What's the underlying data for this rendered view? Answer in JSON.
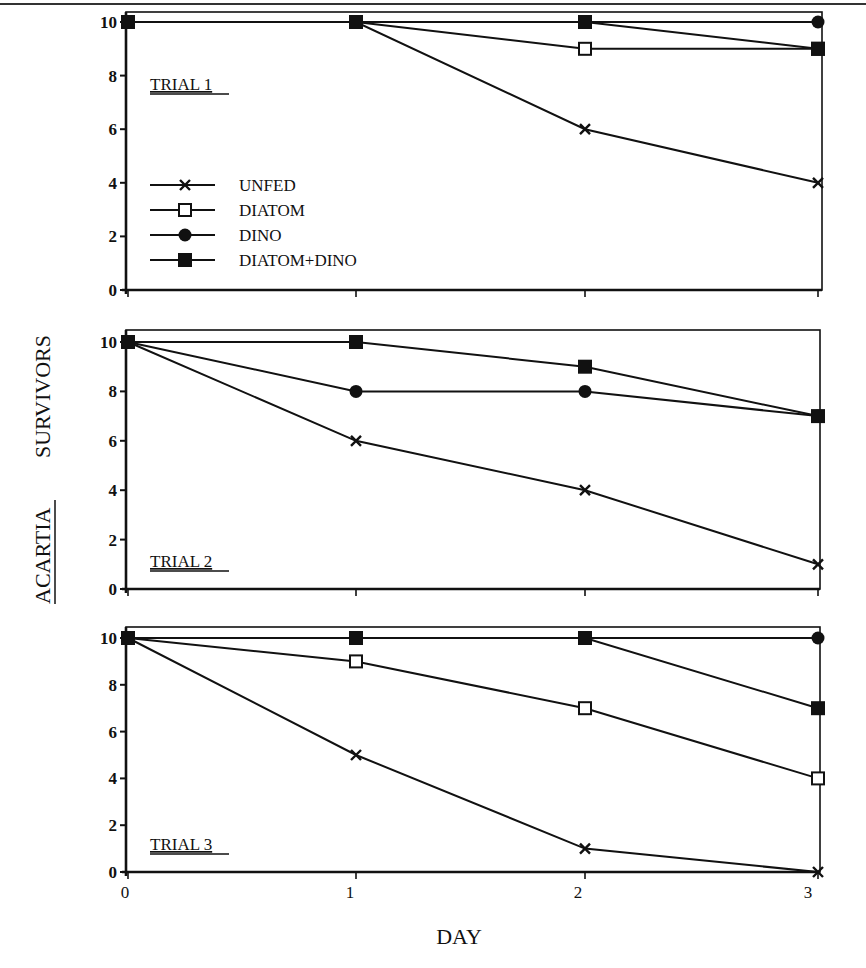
{
  "chart_data": [
    {
      "type": "line",
      "title": "TRIAL 1",
      "x": [
        0,
        1,
        2,
        3
      ],
      "xlabel": "DAY",
      "ylabel": "ACARTIA SURVIVORS",
      "ylim": [
        0,
        10
      ],
      "yticks": [
        0,
        2,
        4,
        6,
        8,
        10
      ],
      "series": [
        {
          "name": "UNFED",
          "marker": "x",
          "values": [
            10,
            10,
            6,
            4
          ]
        },
        {
          "name": "DIATOM",
          "marker": "open-square",
          "values": [
            10,
            10,
            9,
            9
          ]
        },
        {
          "name": "DINO",
          "marker": "filled-circle",
          "values": [
            10,
            10,
            10,
            10
          ]
        },
        {
          "name": "DIATOM+DINO",
          "marker": "filled-square",
          "values": [
            10,
            10,
            10,
            9
          ]
        }
      ],
      "legend_position": "inside-left"
    },
    {
      "type": "line",
      "title": "TRIAL 2",
      "x": [
        0,
        1,
        2,
        3
      ],
      "ylim": [
        0,
        10
      ],
      "yticks": [
        0,
        2,
        4,
        6,
        8,
        10
      ],
      "series": [
        {
          "name": "UNFED",
          "marker": "x",
          "values": [
            10,
            6,
            4,
            1
          ]
        },
        {
          "name": "DINO",
          "marker": "filled-circle",
          "values": [
            10,
            8,
            8,
            7
          ]
        },
        {
          "name": "DIATOM+DINO",
          "marker": "filled-square",
          "values": [
            10,
            10,
            9,
            7
          ]
        }
      ]
    },
    {
      "type": "line",
      "title": "TRIAL 3",
      "x": [
        0,
        1,
        2,
        3
      ],
      "xlabel": "DAY",
      "xticks": [
        0,
        1,
        2,
        3
      ],
      "ylim": [
        0,
        10
      ],
      "yticks": [
        0,
        2,
        4,
        6,
        8,
        10
      ],
      "series": [
        {
          "name": "UNFED",
          "marker": "x",
          "values": [
            10,
            5,
            1,
            0
          ]
        },
        {
          "name": "DIATOM",
          "marker": "open-square",
          "values": [
            10,
            9,
            7,
            4
          ]
        },
        {
          "name": "DINO",
          "marker": "filled-circle",
          "values": [
            10,
            10,
            10,
            10
          ]
        },
        {
          "name": "DIATOM+DINO",
          "marker": "filled-square",
          "values": [
            10,
            10,
            10,
            7
          ]
        }
      ]
    }
  ],
  "labels": {
    "ylabel_species": "ACARTIA",
    "ylabel_rest": "SURVIVORS",
    "xlabel": "DAY",
    "xticks": [
      "0",
      "1",
      "2",
      "3"
    ],
    "yticks": [
      "0",
      "2",
      "4",
      "6",
      "8",
      "10"
    ],
    "trials": [
      "TRIAL 1",
      "TRIAL 2",
      "TRIAL 3"
    ],
    "legend": [
      "UNFED",
      "DIATOM",
      "DINO",
      "DIATOM+DINO"
    ]
  }
}
